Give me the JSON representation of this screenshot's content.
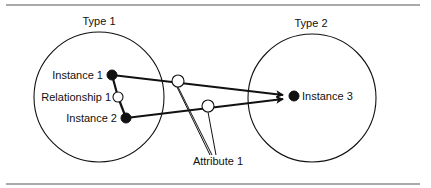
{
  "diagram": {
    "types": [
      {
        "id": "type1",
        "label": "Type 1",
        "cx": 99,
        "cy": 97,
        "r": 65,
        "label_x": 99,
        "label_y": 25
      },
      {
        "id": "type2",
        "label": "Type 2",
        "cx": 312,
        "cy": 98,
        "r": 64,
        "label_x": 311,
        "label_y": 27
      }
    ],
    "instances": [
      {
        "id": "instance1",
        "label": "Instance 1",
        "cx": 112,
        "cy": 75,
        "r": 5,
        "label_x": 103,
        "label_y": 79,
        "anchor": "end"
      },
      {
        "id": "instance2",
        "label": "Instance 2",
        "cx": 126,
        "cy": 118,
        "r": 5,
        "label_x": 117,
        "label_y": 122,
        "anchor": "end"
      },
      {
        "id": "instance3",
        "label": "Instance 3",
        "cx": 294,
        "cy": 96,
        "r": 5,
        "label_x": 302,
        "label_y": 100,
        "anchor": "start"
      }
    ],
    "relationship": {
      "label": "Relationship 1",
      "cx": 118,
      "cy": 97,
      "r": 5,
      "label_x": 111,
      "label_y": 101
    },
    "attribute": {
      "label": "Attribute 1",
      "label_x": 218,
      "label_y": 165,
      "circles": [
        {
          "cx": 178,
          "cy": 81,
          "r": 6
        },
        {
          "cx": 208,
          "cy": 106,
          "r": 6
        }
      ]
    },
    "arrows": [
      {
        "from": "instance1",
        "x1": 112,
        "y1": 75,
        "x2": 283,
        "y2": 95
      },
      {
        "from": "instance2",
        "x1": 126,
        "y1": 118,
        "x2": 283,
        "y2": 99
      }
    ],
    "colors": {
      "stroke": "#111111",
      "fill_solid": "#111111",
      "fill_open": "#ffffff",
      "rule": "#555555"
    }
  }
}
